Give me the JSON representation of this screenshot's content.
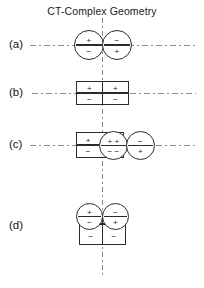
{
  "figure": {
    "title": "CT-Complex Geometry",
    "center_axis_name": "vertical-symmetry-axis",
    "colors": {
      "stroke": "#2b2b2b",
      "axis": "#8a8a8a",
      "background": "#ffffff",
      "text": "#141414"
    }
  },
  "rows": [
    {
      "label": "(a)",
      "description": "two overlapping circles, antiparallel dipoles",
      "shapes": [
        {
          "kind": "circle",
          "top_sign": "+",
          "bottom_sign": "−"
        },
        {
          "kind": "circle",
          "top_sign": "−",
          "bottom_sign": "+"
        }
      ]
    },
    {
      "label": "(b)",
      "description": "two adjoining rectangles, parallel dipoles",
      "shapes": [
        {
          "kind": "rectangle",
          "top_sign": "+",
          "bottom_sign": "−"
        },
        {
          "kind": "rectangle",
          "top_sign": "+",
          "bottom_sign": "−"
        }
      ]
    },
    {
      "label": "(c)",
      "description": "rectangle overlapped by two circles",
      "shapes": [
        {
          "kind": "rectangle",
          "top_sign": "+",
          "bottom_sign": "−"
        },
        {
          "kind": "circle",
          "top_sign": "+ +",
          "bottom_sign": "− −"
        },
        {
          "kind": "circle",
          "top_sign": "−",
          "bottom_sign": "+"
        }
      ]
    },
    {
      "label": "(d)",
      "description": "two circles above two rectangles",
      "shapes": [
        {
          "kind": "circle",
          "top_sign": "+",
          "bottom_sign": "−"
        },
        {
          "kind": "circle",
          "top_sign": "−",
          "bottom_sign": "+"
        },
        {
          "kind": "rectangle",
          "top_sign": "+",
          "bottom_sign": "−"
        },
        {
          "kind": "rectangle",
          "top_sign": "+",
          "bottom_sign": "−"
        }
      ]
    }
  ]
}
